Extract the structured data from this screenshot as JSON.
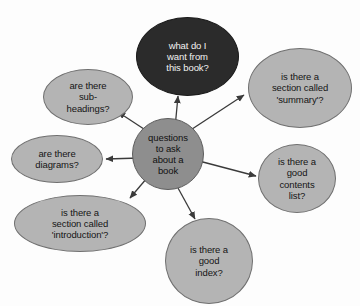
{
  "diagram": {
    "type": "mind-map",
    "title": "questions to ask about a book",
    "background_color": "#fdfdfd",
    "hub": {
      "id": "hub",
      "label": "questions\nto ask\nabout a\nbook",
      "shape": "circle",
      "fill_color": "#8e8e8e",
      "text_color": "#111111",
      "x": 132,
      "y": 118,
      "width": 72,
      "height": 72
    },
    "branches": [
      {
        "id": "sub-headings",
        "label": "are there\nsub-\nheadings?",
        "shape": "ellipse",
        "fill_color": "#b4b4b4",
        "text_color": "#151515",
        "x": 43,
        "y": 69,
        "width": 90,
        "height": 56,
        "arrow_from": "hub",
        "arrow_direction": "up-left"
      },
      {
        "id": "want-from-book",
        "label": "what do I\nwant from\nthis book?",
        "shape": "ellipse",
        "fill_color": "#2b2b2b",
        "text_color": "#f2f2f2",
        "x": 136,
        "y": 17,
        "width": 103,
        "height": 79,
        "arrow_from": "hub",
        "arrow_direction": "up"
      },
      {
        "id": "section-summary",
        "label": "is there a\nsection called\n'summary'?",
        "shape": "ellipse",
        "fill_color": "#b4b4b4",
        "text_color": "#151515",
        "x": 248,
        "y": 48,
        "width": 104,
        "height": 80,
        "arrow_from": "hub",
        "arrow_direction": "up-right"
      },
      {
        "id": "diagrams",
        "label": "are there\ndiagrams?",
        "shape": "ellipse",
        "fill_color": "#b4b4b4",
        "text_color": "#151515",
        "x": 11,
        "y": 135,
        "width": 92,
        "height": 48,
        "arrow_from": "hub",
        "arrow_direction": "left"
      },
      {
        "id": "contents-list",
        "label": "is there a\ngood\ncontents\nlist?",
        "shape": "circle",
        "fill_color": "#b4b4b4",
        "text_color": "#151515",
        "x": 258,
        "y": 144,
        "width": 78,
        "height": 69,
        "arrow_from": "hub",
        "arrow_direction": "right"
      },
      {
        "id": "section-introduction",
        "label": "is there a\nsection called\n'introduction'?",
        "shape": "ellipse",
        "fill_color": "#b4b4b4",
        "text_color": "#151515",
        "x": 14,
        "y": 195,
        "width": 132,
        "height": 57,
        "arrow_from": "hub",
        "arrow_direction": "down-left"
      },
      {
        "id": "index",
        "label": "is there a\ngood\nindex?",
        "shape": "circle",
        "fill_color": "#b4b4b4",
        "text_color": "#151515",
        "x": 165,
        "y": 218,
        "width": 88,
        "height": 86,
        "arrow_from": "hub",
        "arrow_direction": "down"
      }
    ],
    "edges": [
      {
        "id": "edge-sub-headings",
        "from": "hub",
        "to": "sub-headings",
        "x1": 150,
        "y1": 133,
        "x2": 118,
        "y2": 112
      },
      {
        "id": "edge-want-from-book",
        "from": "hub",
        "to": "want-from-book",
        "x1": 175,
        "y1": 128,
        "x2": 178,
        "y2": 96
      },
      {
        "id": "edge-section-summary",
        "from": "hub",
        "to": "section-summary",
        "x1": 186,
        "y1": 133,
        "x2": 244,
        "y2": 95
      },
      {
        "id": "edge-diagrams",
        "from": "hub",
        "to": "diagrams",
        "x1": 140,
        "y1": 158,
        "x2": 106,
        "y2": 159
      },
      {
        "id": "edge-contents-list",
        "from": "hub",
        "to": "contents-list",
        "x1": 199,
        "y1": 161,
        "x2": 256,
        "y2": 176
      },
      {
        "id": "edge-section-introduction",
        "from": "hub",
        "to": "section-introduction",
        "x1": 147,
        "y1": 178,
        "x2": 130,
        "y2": 198
      },
      {
        "id": "edge-index",
        "from": "hub",
        "to": "index",
        "x1": 178,
        "y1": 188,
        "x2": 195,
        "y2": 219
      }
    ],
    "edge_color": "#3a3a3a"
  }
}
